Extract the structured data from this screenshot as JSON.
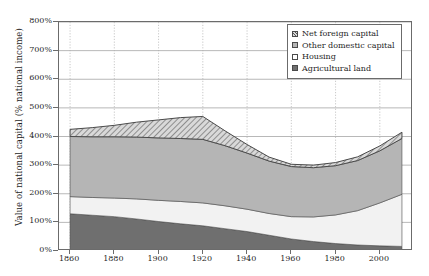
{
  "chart_data": {
    "type": "area",
    "stacked": true,
    "title": "",
    "xlabel": "",
    "ylabel": "Value of national capital (% national income)",
    "xlim": [
      1855,
      2015
    ],
    "ylim": [
      0,
      800
    ],
    "grid": true,
    "legend_position": "top-right",
    "x_ticks": [
      "1860",
      "1880",
      "1900",
      "1920",
      "1940",
      "1960",
      "1980",
      "2000"
    ],
    "x_tick_values": [
      1860,
      1880,
      1900,
      1920,
      1940,
      1960,
      1980,
      2000
    ],
    "y_ticks": [
      "0%",
      "100%",
      "200%",
      "300%",
      "400%",
      "500%",
      "600%",
      "700%",
      "800%"
    ],
    "y_tick_values": [
      0,
      100,
      200,
      300,
      400,
      500,
      600,
      700,
      800
    ],
    "x": [
      1860,
      1870,
      1880,
      1890,
      1900,
      1910,
      1920,
      1930,
      1940,
      1950,
      1960,
      1970,
      1980,
      1990,
      2000,
      2010
    ],
    "series": [
      {
        "name": "Agricultural land",
        "fill": "#6f6f6f",
        "pattern": "solid",
        "values": [
          130,
          125,
          120,
          112,
          103,
          95,
          88,
          78,
          68,
          55,
          42,
          33,
          26,
          21,
          18,
          16
        ]
      },
      {
        "name": "Housing",
        "fill": "#f2f2f2",
        "pattern": "solid",
        "values": [
          60,
          62,
          65,
          70,
          74,
          78,
          80,
          80,
          78,
          76,
          78,
          86,
          100,
          120,
          150,
          182
        ]
      },
      {
        "name": "Other domestic capital",
        "fill": "#b5b5b5",
        "pattern": "solid",
        "values": [
          210,
          212,
          214,
          216,
          218,
          220,
          222,
          210,
          196,
          183,
          175,
          172,
          172,
          175,
          182,
          195
        ]
      },
      {
        "name": "Net foreign capital",
        "fill": "#d9d9d9",
        "pattern": "hatched",
        "values": [
          25,
          32,
          40,
          52,
          63,
          73,
          80,
          52,
          30,
          14,
          8,
          9,
          11,
          13,
          17,
          22
        ]
      }
    ],
    "totals": [
      425,
      431,
      439,
      450,
      458,
      466,
      470,
      420,
      372,
      328,
      303,
      300,
      309,
      329,
      367,
      415
    ]
  }
}
